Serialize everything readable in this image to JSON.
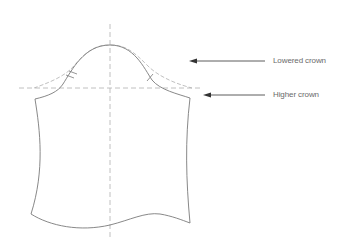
{
  "diagram": {
    "labels": {
      "lowered_crown": "Lowered crown",
      "higher_crown": "Higher crown"
    },
    "colors": {
      "outline": "#7a7a7a",
      "dashed": "#b0b0b0",
      "arrow": "#333333",
      "text": "#6a6a6a",
      "background": "#ffffff"
    }
  }
}
